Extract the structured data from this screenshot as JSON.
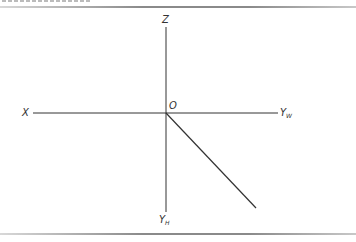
{
  "diagram": {
    "type": "axonometric projection axes",
    "origin": {
      "label": "O",
      "x": 166,
      "y": 113
    },
    "axes": [
      {
        "id": "z",
        "label": "Z",
        "from": [
          166,
          113
        ],
        "to": [
          166,
          27
        ]
      },
      {
        "id": "x",
        "label": "X",
        "from": [
          166,
          113
        ],
        "to": [
          33,
          113
        ]
      },
      {
        "id": "yw",
        "label": "Y",
        "subscript": "W",
        "from": [
          166,
          113
        ],
        "to": [
          278,
          113
        ]
      },
      {
        "id": "yh",
        "label": "Y",
        "subscript": "H",
        "from": [
          166,
          113
        ],
        "to": [
          166,
          212
        ]
      },
      {
        "id": "diagonal",
        "label": "",
        "from": [
          166,
          113
        ],
        "to": [
          256,
          208
        ]
      }
    ],
    "labels": {
      "z": "Z",
      "x": "X",
      "o": "O",
      "yw_main": "Y",
      "yw_sub": "W",
      "yh_main": "Y",
      "yh_sub": "H"
    },
    "colors": {
      "line": "#333333",
      "rule": "#8a8a8a",
      "background": "#ffffff"
    }
  }
}
